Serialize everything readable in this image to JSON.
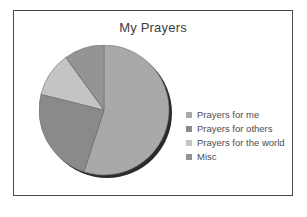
{
  "chart_data": {
    "type": "pie",
    "title": "My Prayers",
    "categories": [
      "Prayers for me",
      "Prayers for others",
      "Prayers for the world",
      "Misc"
    ],
    "values": [
      55,
      24,
      11,
      10
    ],
    "units": "percent",
    "colors": [
      "#a9a9a9",
      "#8a8a8a",
      "#c4c4c4",
      "#949494"
    ],
    "legend_position": "right",
    "grid": false,
    "slices": [
      {
        "label": "Prayers for me",
        "value": 55,
        "color": "#a9a9a9",
        "start_deg": 0,
        "end_deg": 198
      },
      {
        "label": "Prayers for others",
        "value": 24,
        "color": "#8a8a8a",
        "start_deg": 198,
        "end_deg": 284
      },
      {
        "label": "Prayers for the world",
        "value": 11,
        "color": "#c4c4c4",
        "start_deg": 284,
        "end_deg": 324
      },
      {
        "label": "Misc",
        "value": 10,
        "color": "#949494",
        "start_deg": 324,
        "end_deg": 360
      }
    ]
  },
  "frame": {
    "border_color": "#4a4a4a",
    "background": "#ffffff"
  },
  "pie": {
    "shadow_color": "#2b2b2b",
    "outline_color": "#6e6e6e"
  }
}
